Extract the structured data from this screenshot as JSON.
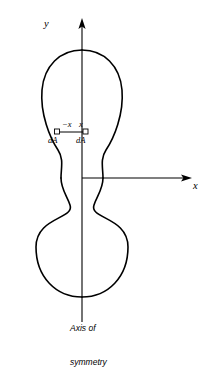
{
  "figure": {
    "background_color": "#ffffff",
    "stroke_color": "#000000",
    "axes": {
      "y_label": "y",
      "x_label": "x",
      "origin": {
        "x": 82,
        "y": 178
      },
      "y_axis": {
        "x": 82,
        "top": 22,
        "bottom": 322,
        "arrow": "up"
      },
      "x_axis": {
        "y": 178,
        "left": 82,
        "right": 190,
        "arrow": "right"
      }
    },
    "elements": {
      "neg_x_label": "−x",
      "pos_x_label": "x",
      "dA_left_label": "dA",
      "dA_right_label": "dA",
      "marker_left": {
        "x": 57,
        "y": 132
      },
      "marker_right": {
        "x": 85,
        "y": 132
      },
      "connector": {
        "y": 132,
        "x1": 57,
        "x2": 85
      }
    },
    "caption": {
      "line1": "Axis of",
      "line2": "symmetry"
    },
    "outline": {
      "type": "closed-curve",
      "upper_lobe": {
        "center_x": 82,
        "center_y": 110,
        "left": 17,
        "right": 122,
        "top": 50,
        "bottom": 176
      },
      "lower_lobe": {
        "center_x": 82,
        "center_y": 240,
        "left": 13,
        "right": 128,
        "top": 180,
        "bottom": 297
      },
      "waist": {
        "y": 178,
        "left": 60,
        "right": 103
      },
      "path": "M 82 50 C 112 50 122 74 122 97 C 122 120 113 142 106 155 C 101 164 103 171 103 178 C 103 188 98 195 96 204 C 92 216 128 215 128 245 C 128 276 108 297 82 297 C 56 297 36 276 36 245 C 36 215 72 216 68 204 C 66 195 61 188 61 178 C 61 171 63 164 58 155 C 51 142 42 120 42 97 C 42 74 52 50 82 50 Z"
    }
  }
}
